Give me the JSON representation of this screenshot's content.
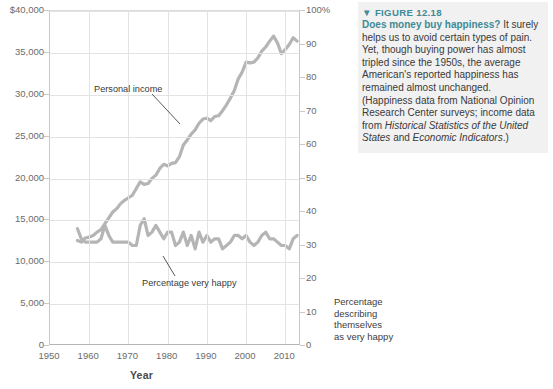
{
  "caption": {
    "marker": "▼",
    "header": "FIGURE 12.18",
    "lead": "Does money buy happiness?",
    "body": " It surely helps us to avoid certain types of pain. Yet, though buying power has almost tripled since the 1950s, the average American's reported happiness has remained almost unchanged. (Happiness data from National Opinion Research Center surveys; income data from ",
    "italic1": "Historical Statistics of the United States",
    "mid": " and ",
    "italic2": "Economic Indicators",
    "tail": ".)",
    "accent_color": "#3f8a96"
  },
  "right_axis_note": {
    "line1": "Percentage",
    "line2": "describing",
    "line3": "themselves",
    "line4": "as very happy"
  },
  "annotations": {
    "income_label": "Personal income",
    "happy_label": "Percentage very happy"
  },
  "chart_data": {
    "type": "line",
    "title": "",
    "xlabel": "Year",
    "ylabel": "",
    "xlim": [
      1950,
      2014
    ],
    "xticks": [
      1950,
      1960,
      1970,
      1980,
      1990,
      2000,
      2010
    ],
    "xticklabels": [
      "1950",
      "1960",
      "1970",
      "1980",
      "1990",
      "2000",
      "2010"
    ],
    "grid": true,
    "legend": "none",
    "axes": [
      {
        "id": "left",
        "name": "Personal income (inflation-adjusted dollars)",
        "lim": [
          0,
          40000
        ],
        "ticks": [
          0,
          5000,
          10000,
          15000,
          20000,
          25000,
          30000,
          35000,
          40000
        ],
        "ticklabels": [
          "0",
          "5,000",
          "10,000",
          "15,000",
          "20,000",
          "25,000",
          "30,000",
          "35,000",
          "$40,000"
        ]
      },
      {
        "id": "right",
        "name": "Percentage describing themselves as very happy",
        "lim": [
          0,
          100
        ],
        "ticks": [
          0,
          10,
          20,
          30,
          40,
          50,
          60,
          70,
          80,
          90,
          100
        ],
        "ticklabels": [
          "0",
          "10",
          "20",
          "30",
          "40",
          "50",
          "60",
          "70",
          "80",
          "90",
          "100%"
        ]
      }
    ],
    "series": [
      {
        "name": "Personal income",
        "axis": "left",
        "color": "#b5b5b5",
        "x": [
          1957,
          1958,
          1959,
          1960,
          1961,
          1962,
          1963,
          1964,
          1965,
          1966,
          1967,
          1968,
          1969,
          1970,
          1971,
          1972,
          1973,
          1974,
          1975,
          1976,
          1977,
          1978,
          1979,
          1980,
          1981,
          1982,
          1983,
          1984,
          1985,
          1986,
          1987,
          1988,
          1989,
          1990,
          1991,
          1992,
          1993,
          1994,
          1995,
          1996,
          1997,
          1998,
          1999,
          2000,
          2001,
          2002,
          2003,
          2004,
          2005,
          2006,
          2007,
          2008,
          2009,
          2010,
          2011,
          2012,
          2013
        ],
        "values": [
          12600,
          12400,
          12900,
          13000,
          13200,
          13600,
          13900,
          14600,
          15300,
          16000,
          16400,
          17000,
          17400,
          17700,
          18000,
          18800,
          19600,
          19300,
          19400,
          20000,
          20400,
          21200,
          21700,
          21500,
          21800,
          21900,
          22600,
          24000,
          24600,
          25300,
          25800,
          26600,
          27100,
          27200,
          26900,
          27400,
          27500,
          28100,
          28800,
          29600,
          30500,
          31900,
          32700,
          33900,
          33800,
          33900,
          34400,
          35200,
          35700,
          36400,
          37000,
          36200,
          34900,
          35400,
          36000,
          36800,
          36400
        ]
      },
      {
        "name": "Percentage very happy",
        "axis": "right",
        "color": "#b5b5b5",
        "x": [
          1957,
          1958,
          1959,
          1960,
          1961,
          1962,
          1963,
          1964,
          1965,
          1966,
          1967,
          1968,
          1969,
          1970,
          1971,
          1972,
          1973,
          1974,
          1975,
          1976,
          1977,
          1978,
          1979,
          1980,
          1981,
          1982,
          1983,
          1984,
          1985,
          1986,
          1987,
          1988,
          1989,
          1990,
          1991,
          1992,
          1993,
          1994,
          1995,
          1996,
          1997,
          1998,
          1999,
          2000,
          2001,
          2002,
          2003,
          2004,
          2005,
          2006,
          2007,
          2008,
          2009,
          2010,
          2011,
          2012,
          2013
        ],
        "values": [
          35,
          32,
          31,
          31,
          31,
          31,
          32,
          36,
          33,
          31,
          31,
          31,
          31,
          31,
          30,
          30,
          36,
          38,
          33,
          34,
          36,
          34,
          32,
          34,
          34,
          30,
          31,
          34,
          30,
          33,
          29,
          34,
          31,
          33,
          31,
          32,
          32,
          29,
          30,
          31,
          33,
          33,
          32,
          33,
          31,
          30,
          31,
          33,
          34,
          32,
          32,
          31,
          30,
          30,
          29,
          32,
          33
        ]
      }
    ]
  }
}
